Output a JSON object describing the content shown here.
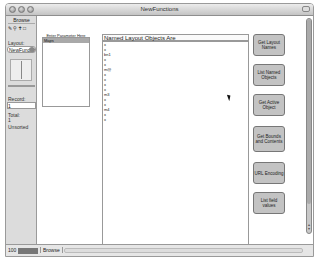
{
  "window": {
    "title": "NewFunctions"
  },
  "status_area": {
    "mode": "Browse",
    "layout_label": "Layout:",
    "layout_value": "NewFunctio",
    "record_label": "Record:",
    "record_value": "1",
    "total_label": "Total:",
    "total_value": "1",
    "sort_status": "Unsorted"
  },
  "param_panel": {
    "label": "Enter Parameter Here",
    "value": "Maps"
  },
  "list_panel": {
    "header": "Named Layout Objects Are",
    "lines": [
      "x",
      "x",
      "bn1",
      "x",
      "x",
      "m@",
      "x",
      "x",
      "x",
      "x",
      "m3",
      "x",
      "x",
      "m4",
      "x",
      "x"
    ]
  },
  "buttons": [
    {
      "label": "Get Layout Names"
    },
    {
      "label": "List Named Objects"
    },
    {
      "label": "Get Active Object"
    },
    {
      "label": "Get Bounds and Contents"
    },
    {
      "label": "URL Encoding"
    },
    {
      "label": "List field values"
    }
  ],
  "bottom_bar": {
    "zoom": "100",
    "mode": "Browse"
  }
}
